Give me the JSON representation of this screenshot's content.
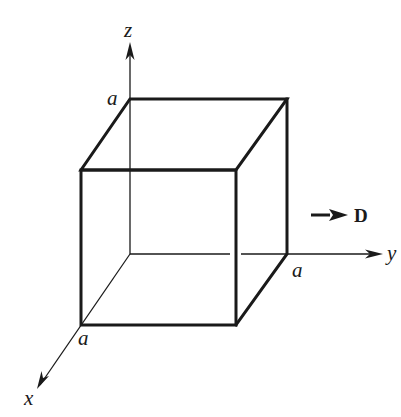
{
  "diagram": {
    "type": "3d-cube-coordinate-figure",
    "axes": {
      "x": {
        "label": "x"
      },
      "y": {
        "label": "y"
      },
      "z": {
        "label": "z"
      }
    },
    "side_labels": {
      "z_intercept": "a",
      "y_intercept": "a",
      "x_intercept": "a"
    },
    "field": {
      "label": "D",
      "direction": "+y"
    },
    "colors": {
      "stroke": "#1a1a1a",
      "background": "#ffffff"
    }
  }
}
